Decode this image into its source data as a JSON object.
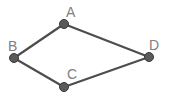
{
  "diagram": {
    "nodes": [
      {
        "id": "A",
        "label": "A",
        "x": 64,
        "y": 24,
        "lx": 66,
        "ly": 17
      },
      {
        "id": "B",
        "label": "B",
        "x": 14,
        "y": 58,
        "lx": 18,
        "ly": 51
      },
      {
        "id": "C",
        "label": "C",
        "x": 64,
        "y": 87,
        "lx": 67,
        "ly": 79
      },
      {
        "id": "D",
        "label": "D",
        "x": 149,
        "y": 57,
        "lx": 149,
        "ly": 50
      }
    ],
    "edges": [
      {
        "from": "B",
        "to": "A"
      },
      {
        "from": "A",
        "to": "D"
      },
      {
        "from": "B",
        "to": "C"
      },
      {
        "from": "C",
        "to": "D"
      }
    ],
    "colors": {
      "edge": "#4d4d4d",
      "node": "#5a5a5a",
      "label": "#808080"
    }
  }
}
